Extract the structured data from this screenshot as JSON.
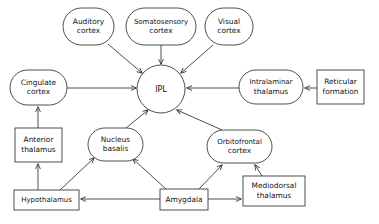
{
  "diagram": {
    "colors": {
      "stroke": "#3a3a3a",
      "fill": "#ffffff",
      "text": "#121212"
    },
    "nodes": [
      {
        "id": "auditory_cortex",
        "label_lines": [
          "Auditory",
          "cortex"
        ],
        "shape": "stadium",
        "x": 63,
        "y": 8,
        "w": 51,
        "h": 37
      },
      {
        "id": "somatosensory_cortex",
        "label_lines": [
          "Somatosensory",
          "cortex"
        ],
        "shape": "stadium",
        "x": 126,
        "y": 8,
        "w": 70,
        "h": 37
      },
      {
        "id": "visual_cortex",
        "label_lines": [
          "Visual",
          "cortex"
        ],
        "shape": "stadium",
        "x": 205,
        "y": 8,
        "w": 48,
        "h": 37
      },
      {
        "id": "ipl",
        "label_lines": [
          "IPL"
        ],
        "shape": "circle",
        "x": 137,
        "y": 65,
        "w": 48,
        "h": 48
      },
      {
        "id": "cingulate_cortex",
        "label_lines": [
          "Cingulate",
          "cortex"
        ],
        "shape": "stadium",
        "x": 10,
        "y": 70,
        "w": 57,
        "h": 35
      },
      {
        "id": "intralaminar_thalamus",
        "label_lines": [
          "Intralaminar",
          "thalamus"
        ],
        "shape": "stadium",
        "x": 239,
        "y": 70,
        "w": 64,
        "h": 34
      },
      {
        "id": "reticular_formation",
        "label_lines": [
          "Reticular",
          "formation"
        ],
        "shape": "rect",
        "x": 317,
        "y": 70,
        "w": 47,
        "h": 34
      },
      {
        "id": "anterior_thalamus",
        "label_lines": [
          "Anterior",
          "thalamus"
        ],
        "shape": "rect",
        "x": 15,
        "y": 128,
        "w": 47,
        "h": 34
      },
      {
        "id": "nucleus_basalis",
        "label_lines": [
          "Nucleus",
          "basalis"
        ],
        "shape": "stadium",
        "x": 88,
        "y": 128,
        "w": 55,
        "h": 33
      },
      {
        "id": "orbitofrontal_cortex",
        "label_lines": [
          "Orbitofrontal",
          "cortex"
        ],
        "shape": "stadium",
        "x": 207,
        "y": 130,
        "w": 65,
        "h": 33
      },
      {
        "id": "hypothalamus",
        "label_lines": [
          "Hypothalamus"
        ],
        "shape": "rect",
        "x": 14,
        "y": 190,
        "w": 65,
        "h": 20
      },
      {
        "id": "amygdala",
        "label_lines": [
          "Amygdala"
        ],
        "shape": "rect",
        "x": 160,
        "y": 189,
        "w": 48,
        "h": 21
      },
      {
        "id": "mediodorsal_thalamus",
        "label_lines": [
          "Mediodorsal",
          "thalamus"
        ],
        "shape": "rect",
        "x": 243,
        "y": 176,
        "w": 62,
        "h": 30
      }
    ],
    "edges": [
      {
        "id": "auditory-to-ipl",
        "from": "auditory_cortex",
        "to": "ipl",
        "points": [
          [
            108,
            44
          ],
          [
            142,
            73
          ]
        ],
        "arrow": "end"
      },
      {
        "id": "somatosensory-to-ipl",
        "from": "somatosensory_cortex",
        "to": "ipl",
        "points": [
          [
            161,
            45
          ],
          [
            161,
            64
          ]
        ],
        "arrow": "end"
      },
      {
        "id": "visual-to-ipl",
        "from": "visual_cortex",
        "to": "ipl",
        "points": [
          [
            213,
            45
          ],
          [
            181,
            73
          ]
        ],
        "arrow": "end"
      },
      {
        "id": "cingulate-to-ipl",
        "from": "cingulate_cortex",
        "to": "ipl",
        "points": [
          [
            67,
            88
          ],
          [
            136,
            88
          ]
        ],
        "arrow": "end"
      },
      {
        "id": "intralaminar-to-ipl",
        "from": "intralaminar_thalamus",
        "to": "ipl",
        "points": [
          [
            239,
            88
          ],
          [
            187,
            88
          ]
        ],
        "arrow": "end"
      },
      {
        "id": "reticular-to-intralam",
        "from": "reticular_formation",
        "to": "intralaminar_thalamus",
        "points": [
          [
            317,
            88
          ],
          [
            305,
            88
          ]
        ],
        "arrow": "end"
      },
      {
        "id": "nucleus-to-ipl",
        "from": "nucleus_basalis",
        "to": "ipl",
        "points": [
          [
            126,
            128
          ],
          [
            148,
            110
          ]
        ],
        "arrow": "end"
      },
      {
        "id": "orbitofrontal-to-ipl",
        "from": "orbitofrontal_cortex",
        "to": "ipl",
        "points": [
          [
            222,
            130
          ],
          [
            177,
            110
          ]
        ],
        "arrow": "end"
      },
      {
        "id": "anterior-to-cingulate",
        "from": "anterior_thalamus",
        "to": "cingulate_cortex",
        "points": [
          [
            38,
            128
          ],
          [
            38,
            107
          ]
        ],
        "arrow": "end"
      },
      {
        "id": "hypothal-to-anterior",
        "from": "hypothalamus",
        "to": "anterior_thalamus",
        "points": [
          [
            38,
            190
          ],
          [
            38,
            164
          ]
        ],
        "arrow": "end"
      },
      {
        "id": "hypothal-to-nucleus",
        "from": "hypothalamus",
        "to": "nucleus_basalis",
        "points": [
          [
            60,
            190
          ],
          [
            94,
            158
          ]
        ],
        "arrow": "end"
      },
      {
        "id": "amygdala-to-nucleus",
        "from": "amygdala",
        "to": "nucleus_basalis",
        "points": [
          [
            166,
            189
          ],
          [
            133,
            159
          ]
        ],
        "arrow": "end"
      },
      {
        "id": "amygdala-to-orbito",
        "from": "amygdala",
        "to": "orbitofrontal_cortex",
        "points": [
          [
            199,
            189
          ],
          [
            222,
            165
          ]
        ],
        "arrow": "end"
      },
      {
        "id": "amygdala-to-hypothal",
        "from": "amygdala",
        "to": "hypothalamus",
        "points": [
          [
            160,
            199
          ],
          [
            81,
            199
          ]
        ],
        "arrow": "end"
      },
      {
        "id": "amygdala-to-mediodorsal",
        "from": "amygdala",
        "to": "mediodorsal_thalamus",
        "points": [
          [
            208,
            199
          ],
          [
            241,
            199
          ]
        ],
        "arrow": "end"
      },
      {
        "id": "mediodorsal-to-orbito",
        "from": "mediodorsal_thalamus",
        "to": "orbitofrontal_cortex",
        "points": [
          [
            262,
            176
          ],
          [
            255,
            165
          ]
        ],
        "arrow": "end"
      }
    ]
  }
}
